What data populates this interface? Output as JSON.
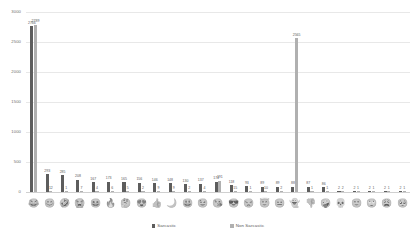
{
  "chart_data": {
    "type": "bar",
    "title": "",
    "subtitle": "",
    "xlabel": "",
    "ylabel": "",
    "ylim": [
      0,
      3000
    ],
    "yticks": [
      0,
      500,
      1000,
      1500,
      2000,
      2500,
      3000
    ],
    "ytick_labels": [
      "0",
      "500",
      "1000",
      "1500",
      "2000",
      "2500",
      "3000"
    ],
    "grid": true,
    "legend_position": "bottom",
    "colors": {
      "sarcastic": "#5d5d5d",
      "non_sarcastic": "#b0b0b0"
    },
    "categories": [
      "face-with-tears-of-joy",
      "smiling-face-with-smiling-eyes",
      "rolling-on-the-floor-laughing",
      "loudly-crying-face",
      "grinning-squinting-face",
      "fire",
      "thinking-face",
      "smiling-face-with-heart-eyes",
      "thumbs-up",
      "crescent-moon",
      "grinning-face-with-big-eyes",
      "winking-face",
      "face-blowing-a-kiss",
      "smiling-face-with-sunglasses",
      "unamused-face",
      "smiling-face-with-halo",
      "neutral-face",
      "ghost",
      "thumbs-down",
      "zany-face",
      "skull",
      "slightly-smiling-face",
      "face-with-rolling-eyes",
      "weary-face",
      "pleading-face"
    ],
    "category_glyphs": [
      "😂",
      "😊",
      "🤣",
      "😭",
      "😆",
      "🔥",
      "🤔",
      "😍",
      "👍",
      "🌙",
      "😃",
      "😉",
      "😘",
      "😎",
      "😒",
      "😇",
      "😐",
      "👻",
      "👎",
      "🤪",
      "💀",
      "🙂",
      "🙄",
      "😩",
      "🥺"
    ],
    "series": [
      {
        "name": "Sarcastic",
        "color": "#5d5d5d",
        "values": [
          2766,
          293,
          285,
          208,
          167,
          173,
          165,
          156,
          146,
          148,
          130,
          137,
          174,
          118,
          93,
          89,
          89,
          88,
          87,
          86,
          2,
          2,
          2,
          2,
          2
        ]
      },
      {
        "name": "Non Sarcastic",
        "color": "#b0b0b0",
        "values": [
          2789,
          12,
          1,
          7,
          4,
          6,
          5,
          2,
          9,
          9,
          2,
          4,
          191,
          15,
          1,
          10,
          2,
          2565,
          1,
          1,
          2,
          1,
          1,
          1,
          1
        ]
      }
    ]
  },
  "legend": {
    "items": [
      {
        "label": "Sarcastic",
        "swatch": "sarc"
      },
      {
        "label": "Non Sarcastic",
        "swatch": "nonsarc"
      }
    ]
  }
}
